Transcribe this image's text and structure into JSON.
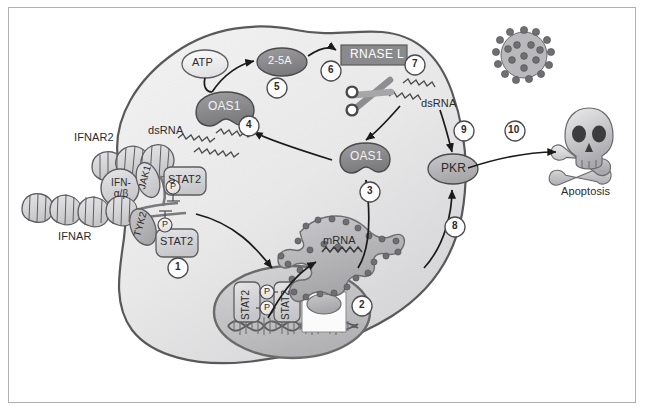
{
  "figure": {
    "frame_color": "#b0b0b0",
    "background": "#ffffff"
  },
  "palette": {
    "cell_fill_light": "#ececed",
    "cell_fill_mid": "#dcdcdd",
    "cell_outline": "#595959",
    "nucleus_fill": "#c9c9ca",
    "nucleus_outline": "#6a6a6a",
    "protein_dark": "#8e8e90",
    "protein_mid": "#b4b4b6",
    "protein_light": "#d8d8da",
    "protein_white": "#f3f3f3",
    "outline": "#4a4a4a",
    "text": "#2b2b2b",
    "text_inverse": "#ffffff",
    "rnase_box": "#8a8a8c",
    "arrow": "#1a1a1a"
  },
  "labels": {
    "ifnar2": "IFNAR2",
    "ifn_ab_line1": "IFN-",
    "ifn_ab_line2": "α/β",
    "ifnar": "IFNAR",
    "jak1": "JAK1",
    "tyk2": "TYK2",
    "stat2_upper": "STAT2",
    "stat2_lower": "STAT2",
    "stat2_nuc_left": "STAT2",
    "stat2_nuc_right": "STAT2",
    "phosphate": "P",
    "dsrna_left": "dsRNA",
    "dsrna_right": "dsRNA",
    "oas1_upper": "OAS1",
    "oas1_lower": "OAS1",
    "atp": "ATP",
    "two_five_a": "2-5A",
    "rnase_l": "RNASE L",
    "pkr": "PKR",
    "mrna": "mRNA",
    "apoptosis": "Apoptosis"
  },
  "steps": [
    {
      "id": "step-1",
      "number": "1",
      "x": 178,
      "y": 268
    },
    {
      "id": "step-2",
      "number": "2",
      "x": 362,
      "y": 306
    },
    {
      "id": "step-3",
      "number": "3",
      "x": 370,
      "y": 192
    },
    {
      "id": "step-4",
      "number": "4",
      "x": 249,
      "y": 126
    },
    {
      "id": "step-5",
      "number": "5",
      "x": 277,
      "y": 88
    },
    {
      "id": "step-6",
      "number": "6",
      "x": 331,
      "y": 71
    },
    {
      "id": "step-7",
      "number": "7",
      "x": 415,
      "y": 65
    },
    {
      "id": "step-8",
      "number": "8",
      "x": 455,
      "y": 227
    },
    {
      "id": "step-9",
      "number": "9",
      "x": 464,
      "y": 131
    },
    {
      "id": "step-10",
      "number": "10",
      "x": 515,
      "y": 131
    }
  ],
  "molecules": {
    "atp": {
      "shape": "ellipse-white"
    },
    "two_five_a": {
      "shape": "ellipse-dark"
    },
    "rnase_l": {
      "shape": "rectangle-gray"
    },
    "oas1": {
      "shape": "kidney-bean-dark"
    },
    "pkr": {
      "shape": "ellipse-mid"
    },
    "virus": {
      "shape": "spiked-particle",
      "spike_count": 16
    },
    "apoptosis": {
      "shape": "skull-and-crossbones"
    },
    "scissors": {
      "shape": "scissors-icon"
    },
    "dna": {
      "shape": "double-helix"
    },
    "rough_er": {
      "shape": "rough-endoplasmic-reticulum"
    }
  }
}
